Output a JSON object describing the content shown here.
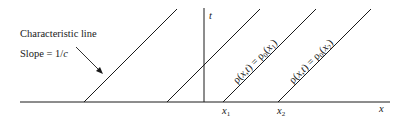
{
  "diagram": {
    "type": "characteristic-lines",
    "annotation": {
      "line1": "Characteristic line",
      "line2_prefix": "Slope = 1/",
      "line2_var": "c"
    },
    "axes": {
      "x_label": "x",
      "t_label": "t"
    },
    "ticks": [
      {
        "base": "x",
        "sub": "1"
      },
      {
        "base": "x",
        "sub": "2"
      }
    ],
    "line_labels": [
      {
        "text_a": "ρ(",
        "var": "x,t",
        "text_b": ") = ρ",
        "sub0": "0",
        "text_c": "(",
        "arg": "x",
        "arg_sub": "1",
        "text_d": ")"
      },
      {
        "text_a": "ρ(",
        "var": "x,t",
        "text_b": ") = ρ",
        "sub0": "0",
        "text_c": "(",
        "arg": "x",
        "arg_sub": "2",
        "text_d": ")"
      }
    ],
    "colors": {
      "ink": "#1a1a1a",
      "background": "#ffffff"
    }
  }
}
